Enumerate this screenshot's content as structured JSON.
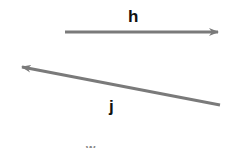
{
  "diagram": {
    "vectors": [
      {
        "name": "h",
        "label": "h",
        "from": [
          65,
          32
        ],
        "to": [
          220,
          32
        ],
        "color": "#7a7a7a"
      },
      {
        "name": "j",
        "label": "j",
        "from": [
          220,
          105
        ],
        "to": [
          20,
          67
        ],
        "color": "#7a7a7a"
      }
    ],
    "partial_label": "w"
  }
}
